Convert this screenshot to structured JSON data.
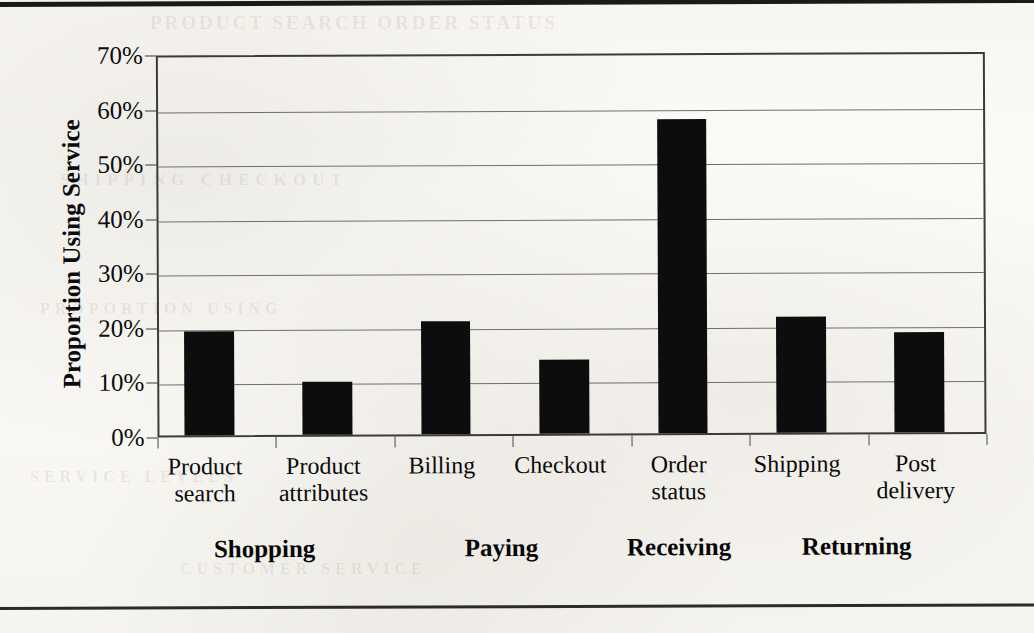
{
  "chart_data": {
    "type": "bar",
    "title": "",
    "xlabel": "",
    "ylabel": "Proportion Using Service",
    "ylim": [
      0,
      70
    ],
    "ytick_values": [
      0,
      10,
      20,
      30,
      40,
      50,
      60,
      70
    ],
    "ytick_labels": [
      "0%",
      "10%",
      "20%",
      "30%",
      "40%",
      "50%",
      "60%",
      "70%"
    ],
    "grid": true,
    "legend": null,
    "bar_color": "#0d0d0d",
    "categories": [
      "Product search",
      "Product attributes",
      "Billing",
      "Checkout",
      "Order status",
      "Shipping",
      "Post delivery"
    ],
    "category_lines": [
      [
        "Product",
        "search"
      ],
      [
        "Product",
        "attributes"
      ],
      [
        "Billing",
        ""
      ],
      [
        "Checkout",
        ""
      ],
      [
        "Order",
        "status"
      ],
      [
        "Shipping",
        ""
      ],
      [
        "Post",
        "delivery"
      ]
    ],
    "values": [
      19.0,
      9.8,
      20.8,
      13.5,
      57.5,
      21.3,
      18.3
    ],
    "value_labels": [
      "19%",
      "10%",
      "21%",
      "14%",
      "58%",
      "21%",
      "18%"
    ],
    "groups": [
      {
        "label": "Shopping",
        "categories": [
          "Product search",
          "Product attributes"
        ]
      },
      {
        "label": "Paying",
        "categories": [
          "Billing",
          "Checkout"
        ]
      },
      {
        "label": "Receiving",
        "categories": [
          "Order status"
        ]
      },
      {
        "label": "Returning",
        "categories": [
          "Shipping",
          "Post delivery"
        ]
      }
    ]
  },
  "page": {
    "ghost_text": [
      "PRODUCT SEARCH  ORDER STATUS",
      "SHIPPING CHECKOUT",
      "PROPORTION USING",
      "SERVICE LEVELS",
      "CUSTOMER SERVICE"
    ]
  }
}
